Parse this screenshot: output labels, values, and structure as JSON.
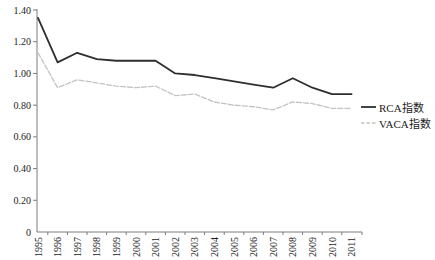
{
  "chart_data": {
    "type": "line",
    "categories": [
      "1995",
      "1996",
      "1997",
      "1998",
      "1999",
      "2000",
      "2001",
      "2002",
      "2003",
      "2004",
      "2005",
      "2006",
      "2007",
      "2008",
      "2009",
      "2010",
      "2011"
    ],
    "series": [
      {
        "name": "RCA指数",
        "style": "solid",
        "color": "#2e2e2e",
        "values": [
          1.35,
          1.07,
          1.13,
          1.09,
          1.08,
          1.08,
          1.08,
          1.0,
          0.99,
          0.97,
          0.95,
          0.93,
          0.91,
          0.97,
          0.91,
          0.87,
          0.87
        ]
      },
      {
        "name": "VACA指数",
        "style": "dashed",
        "color": "#c3c3c3",
        "values": [
          1.13,
          0.91,
          0.96,
          0.94,
          0.92,
          0.91,
          0.92,
          0.86,
          0.87,
          0.82,
          0.8,
          0.79,
          0.77,
          0.82,
          0.81,
          0.78,
          0.78
        ]
      }
    ],
    "ylim": [
      0,
      1.4
    ],
    "y_ticks": {
      "labels": [
        "1.40",
        "1.20",
        "1.00",
        "0.80",
        "0.60",
        "0.40",
        "0.20",
        "0"
      ],
      "values": [
        1.4,
        1.2,
        1.0,
        0.8,
        0.6,
        0.4,
        0.2,
        0
      ]
    },
    "grid": false,
    "legend_position": "right"
  },
  "colors": {
    "axis": "#7d7d7d",
    "tick_label": "#1c1c1c",
    "background": "#ffffff"
  }
}
